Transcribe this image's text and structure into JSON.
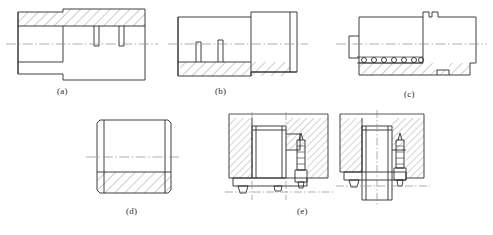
{
  "figure": {
    "kind": "engineering-drawing",
    "background_color": "#ffffff",
    "line_color": "#2b2b2b",
    "hatch_color": "#6b6b6b",
    "centerline_color": "#8a8a8a",
    "width": 493,
    "height": 235,
    "subfigure_count": 5
  },
  "captions": {
    "a": "(a)",
    "b": "(b)",
    "c": "(c)",
    "d": "(d)",
    "e": "(e)"
  },
  "subfigures": [
    {
      "id": "a",
      "label": "(a)",
      "description": "Stepped cylindrical sleeve, half-section, hatching on upper half, two narrow grooves",
      "section_half": "upper",
      "groove_count": 2,
      "has_centerline": true
    },
    {
      "id": "b",
      "label": "(b)",
      "description": "Stepped cylindrical bushing, half-section, hatching on lower half, two blind holes",
      "section_half": "lower",
      "groove_count": 2,
      "has_centerline": true
    },
    {
      "id": "c",
      "label": "(c)",
      "description": "Stepped shaft assembly with knurled / serrated band, lower half section, relief groove",
      "section_half": "lower",
      "serration_count": 7,
      "has_centerline": true
    },
    {
      "id": "d",
      "label": "(d)",
      "description": "Short cylindrical collar with chamfers, lower half in section",
      "section_half": "lower",
      "has_centerline": true
    },
    {
      "id": "e",
      "label": "(e)",
      "description": "Two sectional assembly details of a bushing seated in a housing bore with a locking screw",
      "views": 2,
      "fastener": "locking-screw",
      "has_centerline": true
    }
  ]
}
